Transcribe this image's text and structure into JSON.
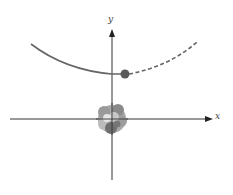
{
  "diagram": {
    "type": "scattering-trajectory",
    "axes": {
      "x_label": "x",
      "y_label": "y"
    },
    "colors": {
      "axis": "#333333",
      "trajectory": "#666666",
      "particle": "#555555",
      "nucleus_light": "#b0b0b0",
      "nucleus_dark": "#707070",
      "nucleus_highlight": "#e0e0e0"
    },
    "elements": {
      "nucleus": "cluster-at-origin",
      "particle": "incoming-particle",
      "path_past": "solid-curve",
      "path_future": "dashed-curve"
    }
  }
}
